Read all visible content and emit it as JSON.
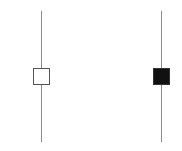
{
  "diagram": {
    "type": "candlestick-comparison",
    "candles": [
      {
        "name": "bullish",
        "fill": "#ffffff",
        "border": "#555555",
        "wick_x": 41,
        "wick_top": 11,
        "wick_bottom": 142,
        "box_left": 33,
        "box_top": 68,
        "box_width": 17,
        "box_height": 17
      },
      {
        "name": "bearish",
        "fill": "#111111",
        "border": "#333333",
        "wick_x": 161,
        "wick_top": 11,
        "wick_bottom": 142,
        "box_left": 153,
        "box_top": 68,
        "box_width": 17,
        "box_height": 17
      }
    ],
    "wick_color": "#8a8a8a"
  }
}
